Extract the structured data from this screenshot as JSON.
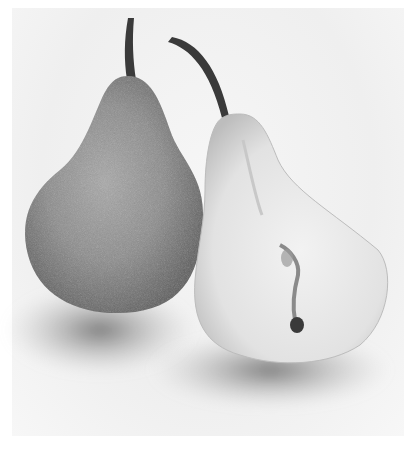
{
  "image": {
    "alt": "Black and white photograph of two pears: a whole speckled pear on the left and a pear cut in half lengthwise on the right showing the core and seeds, casting soft shadows on a white surface",
    "subjects": [
      {
        "name": "whole-pear",
        "description": "Whole pear with speckled skin and upright stem"
      },
      {
        "name": "halved-pear",
        "description": "Pear cut in half showing light flesh, core line and seeds, curved stem"
      }
    ],
    "colors": {
      "background": "#f4f4f4",
      "whole_pear_skin": "#8a8a8a",
      "halved_pear_flesh": "#e6e6e6",
      "stem": "#3a3a3a",
      "shadow": "#6e6e6e"
    }
  }
}
